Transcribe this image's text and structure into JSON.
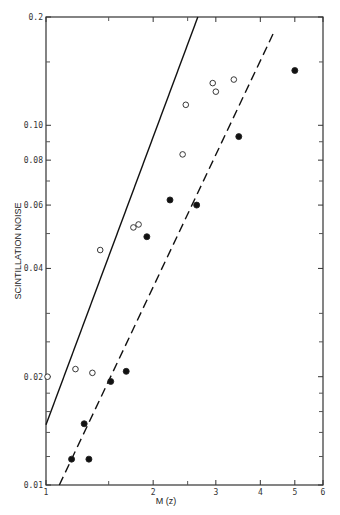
{
  "chart_data": {
    "type": "scatter",
    "title": "",
    "xlabel": "M (z)",
    "ylabel": "SCINTILLATION NOISE",
    "xscale": "log",
    "yscale": "log",
    "xlim": [
      1,
      6
    ],
    "ylim": [
      0.01,
      0.2
    ],
    "x_ticks": [
      1,
      2,
      3,
      4,
      5,
      6
    ],
    "x_tick_labels": [
      "1",
      "2",
      "3",
      "4",
      "5",
      "6"
    ],
    "y_ticks": [
      0.01,
      0.02,
      0.04,
      0.06,
      0.08,
      0.1,
      0.2
    ],
    "y_tick_labels": [
      "0.01",
      "0.02",
      "0.04",
      "0.06",
      "0.08",
      "0.10",
      "0.2"
    ],
    "grid": false,
    "legend": null,
    "series": [
      {
        "name": "open circles",
        "marker": "open-circle",
        "points": [
          [
            1.01,
            0.02
          ],
          [
            1.21,
            0.021
          ],
          [
            1.35,
            0.0205
          ],
          [
            1.42,
            0.045
          ],
          [
            1.76,
            0.052
          ],
          [
            1.82,
            0.053
          ],
          [
            2.42,
            0.083
          ],
          [
            2.47,
            0.114
          ],
          [
            2.94,
            0.131
          ],
          [
            3.0,
            0.124
          ],
          [
            3.37,
            0.134
          ]
        ]
      },
      {
        "name": "filled circles",
        "marker": "filled-circle",
        "points": [
          [
            1.18,
            0.0118
          ],
          [
            1.28,
            0.0148
          ],
          [
            1.32,
            0.0118
          ],
          [
            1.52,
            0.0194
          ],
          [
            1.68,
            0.0207
          ],
          [
            1.92,
            0.049
          ],
          [
            2.23,
            0.062
          ],
          [
            2.65,
            0.06
          ],
          [
            3.48,
            0.093
          ],
          [
            5.0,
            0.142
          ]
        ]
      },
      {
        "name": "fit open (solid line)",
        "style": "solid",
        "line": [
          [
            1.0,
            0.0147
          ],
          [
            2.67,
            0.2
          ]
        ]
      },
      {
        "name": "fit filled (dashed line)",
        "style": "dashed",
        "line": [
          [
            1.09,
            0.01
          ],
          [
            4.35,
            0.18
          ]
        ]
      }
    ]
  }
}
